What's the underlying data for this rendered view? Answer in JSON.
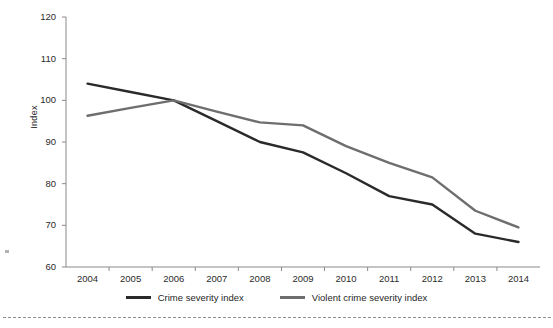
{
  "chart_data": {
    "type": "line",
    "title": "",
    "subtitle": "",
    "xlabel": "",
    "ylabel": "Index",
    "categories": [
      "2004",
      "2005",
      "2006",
      "2007",
      "2008",
      "2009",
      "2010",
      "2011",
      "2012",
      "2013",
      "2014"
    ],
    "x": [
      2004,
      2005,
      2006,
      2007,
      2008,
      2009,
      2010,
      2011,
      2012,
      2013,
      2014
    ],
    "ylim": [
      60,
      120
    ],
    "yticks": [
      60,
      70,
      80,
      90,
      100,
      110,
      120
    ],
    "ytick_labels": [
      "60",
      "70",
      "80",
      "90",
      "100",
      "110",
      "120"
    ],
    "grid": false,
    "legend_position": "bottom-center",
    "series": [
      {
        "name": "Crime severity index",
        "color": "#2a2a2a",
        "values": [
          104.0,
          102.0,
          100.0,
          95.0,
          90.0,
          87.5,
          82.5,
          77.0,
          75.0,
          68.0,
          66.0
        ]
      },
      {
        "name": "Violent crime severity index",
        "color": "#6e6e6e",
        "values": [
          96.3,
          98.2,
          100.0,
          97.3,
          94.7,
          94.0,
          89.0,
          85.0,
          81.5,
          73.5,
          69.5
        ]
      }
    ]
  },
  "axes": {
    "y_title": "Index"
  },
  "legend": {
    "entries": [
      {
        "label": "Crime severity index"
      },
      {
        "label": "Violent crime severity index"
      }
    ]
  }
}
